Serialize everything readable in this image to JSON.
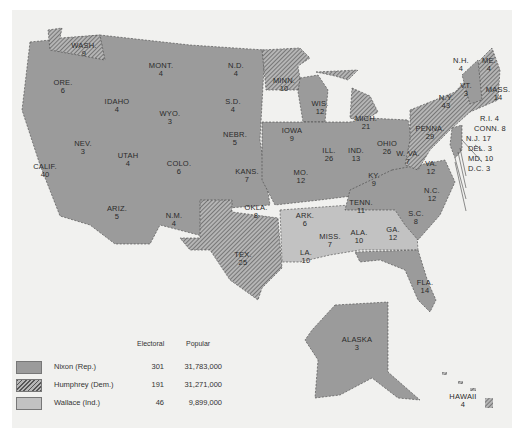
{
  "map": {
    "title": "",
    "colors": {
      "nixon": "#9b9b9b",
      "humphrey_hatch_dark": "#555555",
      "humphrey_hatch_light": "#b5b5b5",
      "wallace": "#c2c2c2",
      "page": "#f1f1ef",
      "border": "#ffffff"
    },
    "states": [
      {
        "abbr": "WASH.",
        "ev": "9",
        "winner": "Humphrey"
      },
      {
        "abbr": "ORE.",
        "ev": "6",
        "winner": "Nixon"
      },
      {
        "abbr": "CALIF.",
        "ev": "40",
        "winner": "Nixon"
      },
      {
        "abbr": "IDAHO",
        "ev": "4",
        "winner": "Nixon"
      },
      {
        "abbr": "NEV.",
        "ev": "3",
        "winner": "Nixon"
      },
      {
        "abbr": "MONT.",
        "ev": "4",
        "winner": "Nixon"
      },
      {
        "abbr": "WYO.",
        "ev": "3",
        "winner": "Nixon"
      },
      {
        "abbr": "UTAH",
        "ev": "4",
        "winner": "Nixon"
      },
      {
        "abbr": "ARIZ.",
        "ev": "5",
        "winner": "Nixon"
      },
      {
        "abbr": "COLO.",
        "ev": "6",
        "winner": "Nixon"
      },
      {
        "abbr": "N.M.",
        "ev": "4",
        "winner": "Nixon"
      },
      {
        "abbr": "N.D.",
        "ev": "4",
        "winner": "Nixon"
      },
      {
        "abbr": "S.D.",
        "ev": "4",
        "winner": "Nixon"
      },
      {
        "abbr": "NEBR.",
        "ev": "5",
        "winner": "Nixon"
      },
      {
        "abbr": "KANS.",
        "ev": "7",
        "winner": "Nixon"
      },
      {
        "abbr": "OKLA.",
        "ev": "8",
        "winner": "Nixon"
      },
      {
        "abbr": "TEX.",
        "ev": "25",
        "winner": "Humphrey"
      },
      {
        "abbr": "MINN.",
        "ev": "10",
        "winner": "Humphrey"
      },
      {
        "abbr": "IOWA",
        "ev": "9",
        "winner": "Nixon"
      },
      {
        "abbr": "MO.",
        "ev": "12",
        "winner": "Nixon"
      },
      {
        "abbr": "ARK.",
        "ev": "6",
        "winner": "Wallace"
      },
      {
        "abbr": "LA.",
        "ev": "10",
        "winner": "Wallace"
      },
      {
        "abbr": "WIS.",
        "ev": "12",
        "winner": "Nixon"
      },
      {
        "abbr": "ILL.",
        "ev": "26",
        "winner": "Nixon"
      },
      {
        "abbr": "MICH.",
        "ev": "21",
        "winner": "Humphrey"
      },
      {
        "abbr": "IND.",
        "ev": "13",
        "winner": "Nixon"
      },
      {
        "abbr": "OHIO",
        "ev": "26",
        "winner": "Nixon"
      },
      {
        "abbr": "KY.",
        "ev": "9",
        "winner": "Nixon"
      },
      {
        "abbr": "TENN.",
        "ev": "11",
        "winner": "Nixon"
      },
      {
        "abbr": "MISS.",
        "ev": "7",
        "winner": "Wallace"
      },
      {
        "abbr": "ALA.",
        "ev": "10",
        "winner": "Wallace"
      },
      {
        "abbr": "GA.",
        "ev": "12",
        "winner": "Wallace"
      },
      {
        "abbr": "FLA.",
        "ev": "14",
        "winner": "Nixon"
      },
      {
        "abbr": "S.C.",
        "ev": "8",
        "winner": "Nixon"
      },
      {
        "abbr": "N.C.",
        "ev": "12",
        "winner": "Nixon"
      },
      {
        "abbr": "VA.",
        "ev": "12",
        "winner": "Nixon"
      },
      {
        "abbr": "W. VA.",
        "ev": "7",
        "winner": "Humphrey"
      },
      {
        "abbr": "PENNA.",
        "ev": "29",
        "winner": "Humphrey"
      },
      {
        "abbr": "N.Y.",
        "ev": "43",
        "winner": "Humphrey"
      },
      {
        "abbr": "VT.",
        "ev": "3",
        "winner": "Nixon"
      },
      {
        "abbr": "N.H.",
        "ev": "4",
        "winner": "Nixon"
      },
      {
        "abbr": "ME.",
        "ev": "4",
        "winner": "Humphrey"
      },
      {
        "abbr": "MASS.",
        "ev": "14",
        "winner": "Humphrey"
      },
      {
        "abbr": "R.I.",
        "ev": "4",
        "winner": "Humphrey"
      },
      {
        "abbr": "CONN.",
        "ev": "8",
        "winner": "Humphrey"
      },
      {
        "abbr": "N.J.",
        "ev": "17",
        "winner": "Nixon"
      },
      {
        "abbr": "DEL.",
        "ev": "3",
        "winner": "Nixon"
      },
      {
        "abbr": "MD.",
        "ev": "10",
        "winner": "Humphrey"
      },
      {
        "abbr": "D.C.",
        "ev": "3",
        "winner": "Humphrey"
      },
      {
        "abbr": "ALASKA",
        "ev": "3",
        "winner": "Nixon"
      },
      {
        "abbr": "HAWAII",
        "ev": "4",
        "winner": "Humphrey"
      }
    ],
    "callouts": {
      "ri": "R.I. 4",
      "conn": "CONN. 8",
      "nj": "N.J. 17",
      "del": "DEL. 3",
      "md": "MD. 10",
      "dc": "D.C. 3"
    }
  },
  "legend": {
    "headers": {
      "electoral": "Electoral",
      "popular": "Popular"
    },
    "rows": [
      {
        "name": "Nixon (Rep.)",
        "electoral": "301",
        "popular": "31,783,000",
        "pattern": "solid-dark"
      },
      {
        "name": "Humphrey (Dem.)",
        "electoral": "191",
        "popular": "31,271,000",
        "pattern": "hatched"
      },
      {
        "name": "Wallace (Ind.)",
        "electoral": "46",
        "popular": "9,899,000",
        "pattern": "solid-light"
      }
    ]
  }
}
